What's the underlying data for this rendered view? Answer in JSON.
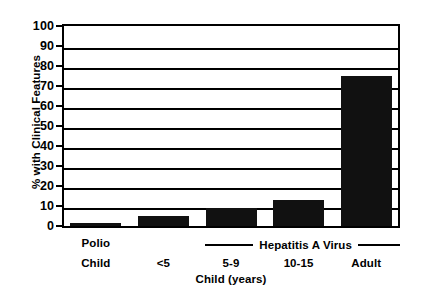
{
  "chart_data": {
    "type": "bar",
    "title": "",
    "xlabel": "Child (years)",
    "ylabel": "% with Clinical Features",
    "ylim": [
      0,
      100
    ],
    "ytick_step": 10,
    "grid": true,
    "legend": "none",
    "categories": [
      "Polio",
      "<5",
      "5-9",
      "10-15",
      "Adult"
    ],
    "category_sublabels": [
      "Child",
      "",
      "",
      "",
      ""
    ],
    "values": [
      1.5,
      5,
      9,
      13,
      75
    ],
    "ytick_labels": [
      "0",
      "10",
      "20",
      "30",
      "40",
      "50",
      "60",
      "70",
      "80",
      "90",
      "100"
    ],
    "ytick_values": [
      0,
      10,
      20,
      30,
      40,
      50,
      60,
      70,
      80,
      90,
      100
    ],
    "group_annotation": "Hepatitis A Virus",
    "group_annotation_members": [
      "<5",
      "5-9",
      "10-15",
      "Adult"
    ],
    "bar_color": "#111111"
  }
}
